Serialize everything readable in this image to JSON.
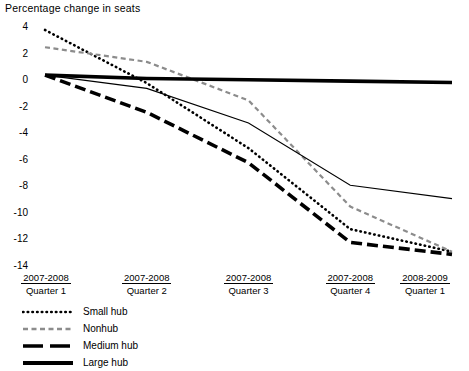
{
  "chart_data": {
    "type": "line",
    "title": "Percentage change in seats",
    "xlabel": "",
    "ylabel": "Percentage change in seats",
    "ylim": [
      -14,
      4
    ],
    "yticks": [
      4,
      2,
      0,
      -2,
      -4,
      -6,
      -8,
      -10,
      -12,
      -14
    ],
    "grid": false,
    "legend_position": "below-left",
    "categories": [
      {
        "top": "2007-2008",
        "bot": "Quarter 1"
      },
      {
        "top": "2007-2008",
        "bot": "Quarter 2"
      },
      {
        "top": "2007-2008",
        "bot": "Quarter 3"
      },
      {
        "top": "2007-2008",
        "bot": "Quarter 4"
      },
      {
        "top": "2008-2009",
        "bot": "Quarter 1"
      }
    ],
    "series": [
      {
        "name": "Small hub",
        "style": "dotted",
        "color": "#000000",
        "width": 2.6,
        "dash": "0.5 4.2",
        "values": [
          3.7,
          -0.3,
          -5.2,
          -11.3,
          -13.0
        ]
      },
      {
        "name": "Nonhub",
        "style": "dashed",
        "color": "#8c8c8c",
        "width": 2.2,
        "dash": "5 3.5",
        "values": [
          2.4,
          1.3,
          -1.6,
          -9.6,
          -13.0
        ]
      },
      {
        "name": "Medium hub",
        "style": "long-dashed",
        "color": "#000000",
        "width": 3.6,
        "dash": "11 5",
        "values": [
          0.3,
          -2.5,
          -6.3,
          -12.3,
          -13.2
        ]
      },
      {
        "name": "Large hub",
        "style": "solid-thick",
        "color": "#000000",
        "width": 3.6,
        "dash": "none",
        "values": [
          0.3,
          0.05,
          -0.05,
          -0.15,
          -0.25
        ]
      },
      {
        "name": "Unlabeled thin line",
        "style": "solid-thin",
        "color": "#000000",
        "width": 1.1,
        "dash": "none",
        "values": [
          0.3,
          -0.7,
          -3.3,
          -8.0,
          -9.0
        ],
        "in_legend": false
      }
    ]
  },
  "legend": {
    "items": [
      {
        "label": "Small hub"
      },
      {
        "label": "Nonhub"
      },
      {
        "label": "Medium hub"
      },
      {
        "label": "Large hub"
      }
    ]
  }
}
